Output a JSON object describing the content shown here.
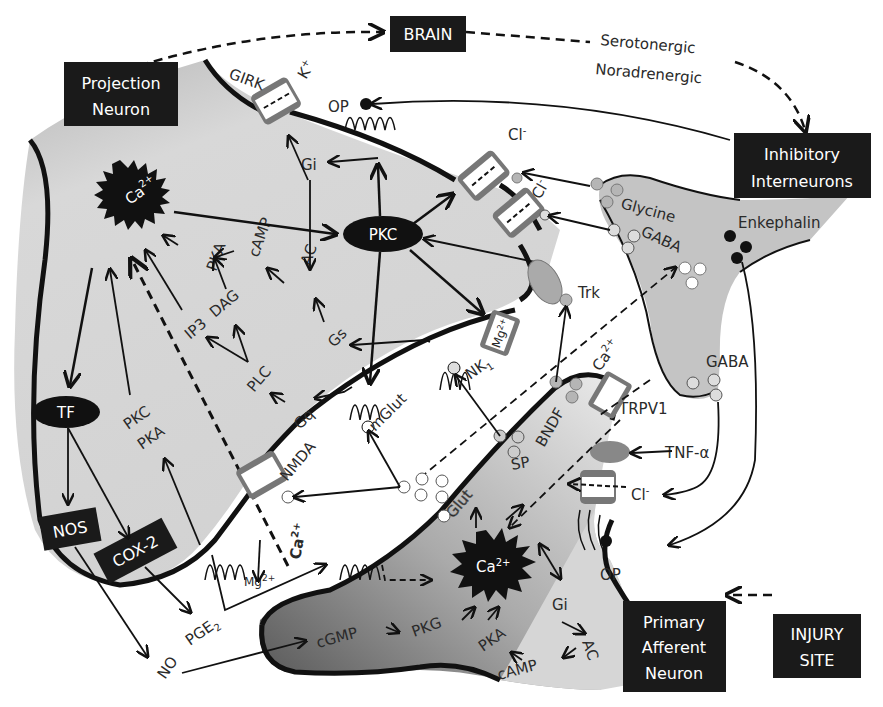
{
  "boxes": {
    "brain": "BRAIN",
    "projection_neuron_line1": "Projection",
    "projection_neuron_line2": "Neuron",
    "inhibitory_line1": "Inhibitory",
    "inhibitory_line2": "Interneurons",
    "primary_line1": "Primary",
    "primary_line2": "Afferent",
    "primary_line3": "Neuron",
    "injury_line1": "INJURY",
    "injury_line2": "SITE",
    "nos": "NOS",
    "cox2": "COX-2"
  },
  "descending": {
    "serotonergic": "Serotonergic",
    "noradrenergic": "Noradrenergic"
  },
  "projection_neuron": {
    "ca": "Ca",
    "ca_sup": "2+",
    "pkc_node": "PKC",
    "tf_node": "TF",
    "girk": "GIRK",
    "k": "K",
    "k_sup": "+",
    "op": "OP",
    "gi": "Gi",
    "ac": "AC",
    "camp": "cAMP",
    "pka": "PKA",
    "ip3": "IP3",
    "dag": "DAG",
    "plc": "PLC",
    "gs": "Gs",
    "gq": "Gq",
    "pkc_left": "PKC",
    "pka_left": "PKA",
    "nmda": "NMDA",
    "mglut": "mGlut",
    "nk1": "NK",
    "nk1_sub": "1",
    "mg_channel": "Mg",
    "mg_sup": "2+",
    "mg_out": "Mg",
    "ca_in": "Ca",
    "cl1": "Cl",
    "cl2": "Cl",
    "cl_sup": "-",
    "trk": "Trk"
  },
  "extracellular": {
    "no": "NO",
    "pge2": "PGE",
    "pge2_sub": "2",
    "ca_dashed": "Ca",
    "ca_sup": "2+"
  },
  "interneuron": {
    "glycine": "Glycine",
    "gaba_top": "GABA",
    "gaba_bottom": "GABA",
    "enkephalin": "Enkephalin"
  },
  "primary_afferent": {
    "glut": "Glut",
    "sp": "SP",
    "bndf": "BNDF",
    "trpv1": "TRPV1",
    "tnf": "TNF-α",
    "cl": "Cl",
    "cl_sup": "-",
    "op": "OP",
    "ca": "Ca",
    "ca_sup": "2+",
    "gi": "Gi",
    "ac": "AC",
    "camp": "cAMP",
    "pka": "PKA",
    "pkg": "PKG",
    "cgmp": "cGMP"
  },
  "colors": {
    "box_fill": "#1a1a1a",
    "cell_fill": "#d4d4d4",
    "interneuron_fill": "#c4c4c4",
    "membrane": "#111111",
    "vesicle_grey": "#b5b5b5"
  }
}
